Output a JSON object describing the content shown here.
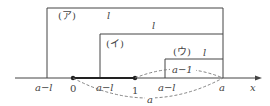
{
  "diagram": {
    "boxes": [
      {
        "tag": "(ア)",
        "length_label": "l"
      },
      {
        "tag": "(イ)",
        "length_label": "l"
      },
      {
        "tag": "(ウ)",
        "length_label": "l"
      }
    ],
    "axis": {
      "var_label": "x",
      "ticks": [
        {
          "id": "a_minus_l_1",
          "label": "a−l"
        },
        {
          "id": "zero",
          "label": "0"
        },
        {
          "id": "a_minus_l_2",
          "label": "a−l"
        },
        {
          "id": "one",
          "label": "1"
        },
        {
          "id": "a_minus_l_3",
          "label": "a−l"
        },
        {
          "id": "a",
          "label": "a"
        }
      ]
    },
    "arcs": [
      {
        "label": "a−1"
      },
      {
        "label": "a"
      }
    ],
    "colors": {
      "line": "#444444",
      "dashed": "#777777",
      "background": "#ffffff"
    }
  }
}
